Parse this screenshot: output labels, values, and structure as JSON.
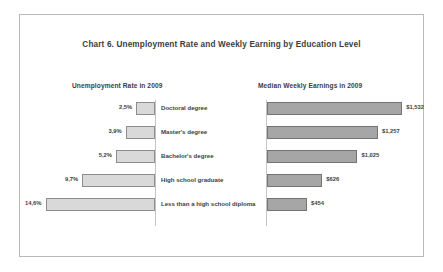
{
  "chart_data": {
    "type": "bar",
    "title": "Chart 6. Unemployment Rate and Weekly Earning by Education Level",
    "layout": "diverging-bar-pyramid",
    "grid": false,
    "legend": "none",
    "categories": [
      "Doctoral degree",
      "Master's degree",
      "Bachelor's degree",
      "High school graduate",
      "Less than a high school diploma"
    ],
    "series": [
      {
        "name": "Unemployment Rate in 2009",
        "side": "left",
        "unit": "percent",
        "values": [
          2.5,
          3.9,
          5.2,
          9.7,
          14.6
        ],
        "labels": [
          "2,5%",
          "3,9%",
          "5,2%",
          "9,7%",
          "14,6%"
        ],
        "xlim": [
          0,
          16
        ],
        "direction": "right-to-left",
        "fill": "#d9d9d9",
        "stroke": "#8d8d8d"
      },
      {
        "name": "Median Weekly Earnings in 2009",
        "side": "right",
        "unit": "usd",
        "values": [
          1532,
          1257,
          1025,
          626,
          454
        ],
        "labels": [
          "$1,532",
          "$1,257",
          "$1,025",
          "$626",
          "$454"
        ],
        "xlim": [
          0,
          1700
        ],
        "direction": "left-to-right",
        "fill": "#a6a6a6",
        "stroke": "#737373"
      }
    ],
    "xlabel": "",
    "ylabel": ""
  },
  "headings": {
    "left": "Unemployment Rate in 2009",
    "right": "Median Weekly Earnings in 2009"
  },
  "style": {
    "frame_color": "#b9b9b9",
    "axis_color": "#c4c4c4",
    "text_color": "#3d3d3d",
    "background": "#ffffff"
  }
}
